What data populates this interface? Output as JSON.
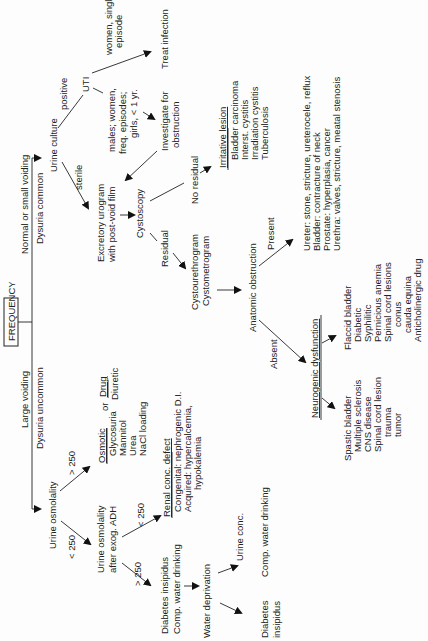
{
  "root": {
    "label": "FREQUENCY"
  },
  "branches": {
    "left": {
      "label": "Large voiding",
      "sub": "Dysuria uncommon"
    },
    "right": {
      "label": "Normal or small voiding",
      "sub": "Dysuria common"
    }
  },
  "large_voiding": {
    "urine_osmolality": "Urine osmolality",
    "gt250": "> 250",
    "lt250": "< 250",
    "osmotic": {
      "title": "Osmotic",
      "items": [
        "Glycosuria",
        "Mannitol",
        "Urea",
        "NaCl loading"
      ]
    },
    "or": "or",
    "drug": {
      "title": "Drug",
      "items": [
        "Diuretic"
      ]
    },
    "adh_line1": "Urine osmolality",
    "adh_line2": "after exog. ADH",
    "adh_lt250": "< 250",
    "adh_gt250": "> 250",
    "renal": {
      "title": "Renal conc. defect",
      "items": [
        "Congenital: nephrogenic D.I.",
        "Acquired: hypercalcemia,",
        "hypokalemia"
      ]
    },
    "di_line1": "Diabetes insipidus",
    "di_line2": "Comp. water drinking",
    "water_deprivation": "Water deprivation",
    "urine_conc": "Urine conc.",
    "comp_water": "Comp. water drinking",
    "di_result_1": "Diabetes",
    "di_result_2": "insipidus"
  },
  "small_voiding": {
    "urine_culture": "Urine culture",
    "positive": "positive",
    "sterile": "sterile",
    "uti": "UTI",
    "women_single_1": "women, single",
    "women_single_2": "episode",
    "treat_infection": "Treat infection",
    "males_1": "males; women,",
    "males_2": "freq. episodes;",
    "males_3": "girls, < 1 yr.",
    "investigate_1": "Investigate for",
    "investigate_2": "obstruction",
    "urogram_1": "Excretory urogram",
    "urogram_2": "with post-void film",
    "cystoscopy": "Cystoscopy",
    "no_residual": "No residual",
    "residual": "Residual",
    "irritative": {
      "title": "Irritative lesion",
      "items": [
        "Bladder carcinoma",
        "Interst. cystitis",
        "Irradiation cystitis",
        "Tuberculosis"
      ]
    },
    "cysto_1": "Cystourethrogram",
    "cysto_2": "Cystometrogram",
    "anatomic": "Anatomic obstruction",
    "present": "Present",
    "absent": "Absent",
    "anatomic_list": [
      "Ureter: stone, stricture, ureterocele, reflux",
      "Bladder: contracture of neck",
      "Prostate: hyperplasia, cancer",
      "Urethra: valves, stricture, meatal stenosis"
    ],
    "neurogenic": "Neurogenic dysfunction",
    "spastic": [
      "Spastic bladder",
      "Multiple sclerosis",
      "CNS disease",
      "Spinal cord lesion",
      "trauma",
      "tumor"
    ],
    "flaccid": [
      "Flaccid bladder",
      "Diabetic",
      "Syphilitic",
      "Pernicious anemia",
      "Spinal cord lesions",
      "conus",
      "cauda equina",
      "Anticholinergic drug"
    ]
  }
}
